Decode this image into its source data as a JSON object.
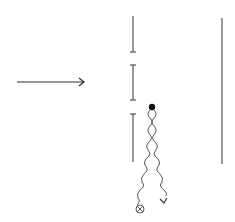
{
  "diagram": {
    "title": "",
    "background": "#ffffff",
    "stroke_color": "#333333",
    "incident_arrow": {
      "x1": 17,
      "y1": 82,
      "x2": 84,
      "y2": 82,
      "icon": "arrow-right-icon"
    },
    "barrier": {
      "x": 133,
      "segments": [
        {
          "y1": 16,
          "y2": 52,
          "tick_top": false,
          "tick_bottom": true
        },
        {
          "y1": 65,
          "y2": 100,
          "tick_top": true,
          "tick_bottom": true
        },
        {
          "y1": 114,
          "y2": 162,
          "tick_top": true,
          "tick_bottom": false
        }
      ]
    },
    "screen": {
      "x": 222,
      "y1": 18,
      "y2": 164
    },
    "source_dot": {
      "x": 152,
      "y": 107,
      "r": 3.2,
      "icon": "filled-dot-icon"
    },
    "wavy_paths": [
      {
        "name": "wavy-path-left",
        "from": [
          152,
          110
        ],
        "to": [
          140,
          205
        ],
        "end": "circled-cross-icon"
      },
      {
        "name": "wavy-path-right",
        "from": [
          152,
          110
        ],
        "to": [
          163,
          202
        ],
        "end": "arrow-head-icon"
      }
    ],
    "circled_cross": {
      "x": 140,
      "y": 209,
      "r": 4
    }
  }
}
